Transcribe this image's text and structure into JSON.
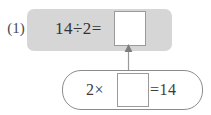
{
  "problem": {
    "number_label": "(1)",
    "equation": {
      "expression": "14÷2=",
      "dividend": "14",
      "divisor": "2",
      "answer_box_value": "",
      "band_color": "#d6d6d6"
    },
    "hint": {
      "left_expression": "2×",
      "right_expression": "=14",
      "answer_box_value": "",
      "capsule_border_color": "#8c8c8c"
    },
    "connector": {
      "icon": "up-arrow-icon",
      "color": "#9a9a9a"
    }
  }
}
